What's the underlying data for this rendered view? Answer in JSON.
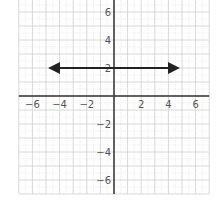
{
  "chart_data": {
    "type": "line",
    "title": "",
    "xlabel": "",
    "ylabel": "",
    "xlim": [
      -7,
      7
    ],
    "ylim": [
      -7,
      7
    ],
    "grid": true,
    "x_ticks": [
      -6,
      -4,
      -2,
      2,
      4,
      6
    ],
    "y_ticks": [
      6,
      4,
      2,
      -2,
      -4,
      -6
    ],
    "x_tick_labels": [
      "−6",
      "−4",
      "−2",
      "2",
      "4",
      "6"
    ],
    "y_tick_labels": [
      "6",
      "4",
      "2",
      "−2",
      "−4",
      "−6"
    ],
    "series": [
      {
        "name": "y = 2",
        "x": [
          -4.7,
          4.7
        ],
        "y": [
          2,
          2
        ],
        "arrows": "both",
        "color": "#222222"
      }
    ]
  },
  "colors": {
    "axis": "#333333",
    "grid_major": "#d8d8d8",
    "grid_minor": "#ececec",
    "line": "#222222"
  }
}
